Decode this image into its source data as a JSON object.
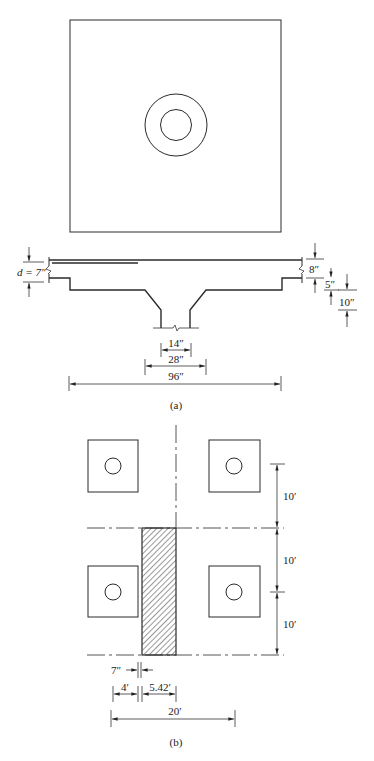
{
  "figure_a": {
    "caption": "(a)",
    "plan": {
      "description": "Square slab panel with column and drop panel/capital shown as concentric circles"
    },
    "section": {
      "labels": {
        "d": "d = 7″",
        "slab_thickness": "8″",
        "drop_depth": "5″",
        "capital_depth": "10″",
        "column_width": "14″",
        "capital_width": "28″",
        "drop_width": "96″"
      }
    }
  },
  "figure_b": {
    "caption": "(b)",
    "labels": {
      "span_1": "10′",
      "span_2": "10′",
      "span_3": "10′",
      "column_gap": "7″",
      "offset": "4′",
      "strip_width": "5.42′",
      "total": "20′"
    }
  }
}
